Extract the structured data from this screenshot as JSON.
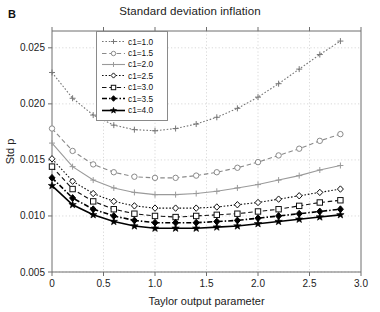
{
  "panel": {
    "label": "B"
  },
  "chart_data": {
    "type": "line",
    "title": "Standard deviation inflation",
    "xlabel": "Taylor output parameter",
    "ylabel": "Std p",
    "xlim": [
      0,
      3.0
    ],
    "ylim": [
      0.005,
      0.0265
    ],
    "xticks": [
      0,
      0.5,
      1.0,
      1.5,
      2.0,
      2.5,
      3.0
    ],
    "xticklabels": [
      "0",
      "0.5",
      "1.0",
      "1.5",
      "2.0",
      "2.5",
      "3.0"
    ],
    "yticks": [
      0.005,
      0.01,
      0.015,
      0.02,
      0.025
    ],
    "yticklabels": [
      "0.005",
      "0.010",
      "0.015",
      "0.020",
      "0.025"
    ],
    "grid": true,
    "legend_position": "top-left-inside",
    "x": [
      0,
      0.2,
      0.4,
      0.6,
      0.8,
      1.0,
      1.2,
      1.4,
      1.6,
      1.8,
      2.0,
      2.2,
      2.4,
      2.6,
      2.8
    ],
    "series": [
      {
        "name": "c1=1.0",
        "label": "c1=1.0",
        "marker": "plus",
        "line": "dotted",
        "color": "#777777",
        "values": [
          0.0228,
          0.0205,
          0.019,
          0.0181,
          0.0177,
          0.0176,
          0.0178,
          0.0182,
          0.0188,
          0.0196,
          0.0206,
          0.0218,
          0.0231,
          0.0244,
          0.0256
        ]
      },
      {
        "name": "c1=1.5",
        "label": "c1=1.5",
        "marker": "circle",
        "line": "dashed",
        "color": "#8a8a8a",
        "values": [
          0.0178,
          0.0158,
          0.0146,
          0.0139,
          0.0135,
          0.0134,
          0.0134,
          0.0136,
          0.0139,
          0.0143,
          0.0148,
          0.0154,
          0.016,
          0.0167,
          0.0173
        ]
      },
      {
        "name": "c1=2.0",
        "label": "c1=2.0",
        "marker": "plus",
        "line": "solid",
        "color": "#9a9a9a",
        "values": [
          0.0165,
          0.0144,
          0.0132,
          0.0125,
          0.0121,
          0.0119,
          0.0119,
          0.012,
          0.0122,
          0.0125,
          0.0128,
          0.0132,
          0.0136,
          0.0141,
          0.0145
        ]
      },
      {
        "name": "c1=2.5",
        "label": "c1=2.5",
        "marker": "diamond-open",
        "line": "dotted",
        "color": "#111111",
        "values": [
          0.0151,
          0.0131,
          0.012,
          0.0113,
          0.0109,
          0.0107,
          0.0107,
          0.0107,
          0.0108,
          0.011,
          0.0112,
          0.0115,
          0.0118,
          0.0121,
          0.0124
        ]
      },
      {
        "name": "c1=3.0",
        "label": "c1=3.0",
        "marker": "square-open",
        "line": "dashed",
        "color": "#111111",
        "values": [
          0.0144,
          0.0124,
          0.0113,
          0.0106,
          0.0102,
          0.01,
          0.0099,
          0.01,
          0.0101,
          0.0102,
          0.0104,
          0.0106,
          0.0109,
          0.0112,
          0.0114
        ]
      },
      {
        "name": "c1=3.5",
        "label": "c1=3.5",
        "marker": "diamond-filled",
        "line": "dash-dot",
        "color": "#000000",
        "values": [
          0.0134,
          0.0116,
          0.0106,
          0.01,
          0.0096,
          0.0094,
          0.0094,
          0.0094,
          0.0095,
          0.0096,
          0.0098,
          0.01,
          0.0102,
          0.0104,
          0.0106
        ]
      },
      {
        "name": "c1=4.0",
        "label": "c1=4.0",
        "marker": "star-filled",
        "line": "solid",
        "color": "#000000",
        "values": [
          0.0127,
          0.011,
          0.0101,
          0.0095,
          0.0091,
          0.0089,
          0.0089,
          0.0089,
          0.009,
          0.0091,
          0.0093,
          0.0095,
          0.0097,
          0.0099,
          0.0101
        ]
      }
    ]
  }
}
